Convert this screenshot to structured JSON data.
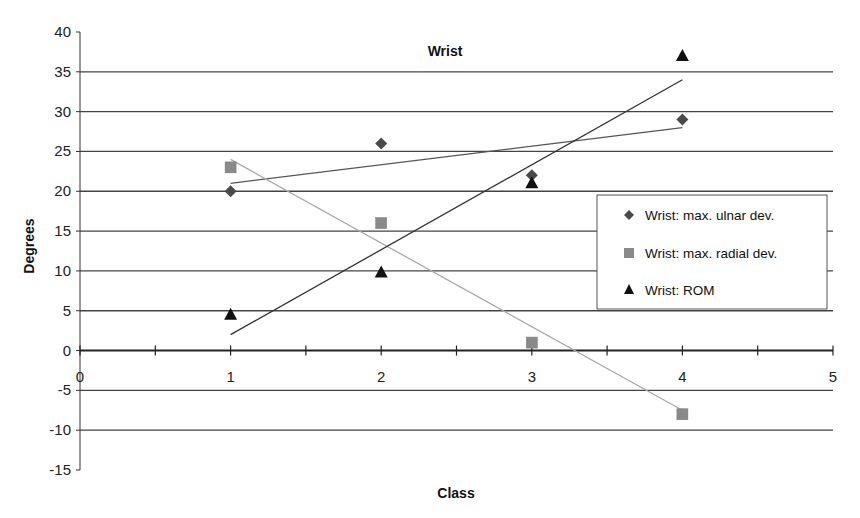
{
  "chart_data": {
    "type": "scatter",
    "title": "Wrist",
    "xlabel": "Class",
    "ylabel": "Degrees",
    "xlim": [
      0,
      5
    ],
    "ylim": [
      -15,
      40
    ],
    "x_ticks": [
      0,
      1,
      2,
      3,
      4,
      5
    ],
    "x_minor_step": 0.5,
    "y_ticks": [
      -15,
      -10,
      -5,
      0,
      5,
      10,
      15,
      20,
      25,
      30,
      35,
      40
    ],
    "grid": "horizontal",
    "legend_position": "right",
    "series": [
      {
        "name": "Wrist: max. ulnar dev.",
        "marker": "diamond",
        "color": "#4a4a4a",
        "x": [
          1,
          2,
          3,
          4
        ],
        "y": [
          20,
          26,
          22,
          29
        ],
        "trendline": {
          "type": "linear",
          "x": [
            1,
            4
          ],
          "y": [
            21,
            28
          ]
        }
      },
      {
        "name": "Wrist: max. radial dev.",
        "marker": "square",
        "color": "#8a8a8a",
        "x": [
          1,
          2,
          3,
          4
        ],
        "y": [
          23,
          16,
          1,
          -8
        ],
        "trendline": {
          "type": "linear",
          "x": [
            1,
            4
          ],
          "y": [
            24,
            -7.5
          ]
        }
      },
      {
        "name": "Wrist: ROM",
        "marker": "triangle",
        "color": "#111111",
        "x": [
          1,
          2,
          3,
          4
        ],
        "y": [
          4.5,
          9.8,
          21,
          37
        ],
        "trendline": {
          "type": "linear",
          "x": [
            1,
            4
          ],
          "y": [
            2,
            34
          ]
        }
      }
    ]
  }
}
